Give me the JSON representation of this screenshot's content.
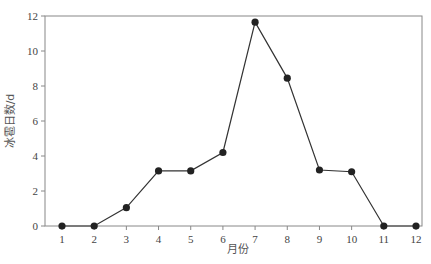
{
  "chart_data": {
    "type": "line",
    "title": "",
    "xlabel": "月份",
    "ylabel": "冰雹日数/d",
    "categories": [
      "1",
      "2",
      "3",
      "4",
      "5",
      "6",
      "7",
      "8",
      "9",
      "10",
      "11",
      "12"
    ],
    "x": [
      1,
      2,
      3,
      4,
      5,
      6,
      7,
      8,
      9,
      10,
      11,
      12
    ],
    "series": [
      {
        "name": "冰雹日数",
        "values": [
          0,
          0,
          1.05,
          3.15,
          3.15,
          4.2,
          11.65,
          8.45,
          3.2,
          3.1,
          0,
          0
        ],
        "marker": "circle",
        "color": "#222222"
      }
    ],
    "ylim": [
      0,
      12
    ],
    "yticks": [
      0,
      2,
      4,
      6,
      8,
      10,
      12
    ],
    "xlim": [
      0.5,
      12.5
    ],
    "grid": false,
    "legend": null
  }
}
